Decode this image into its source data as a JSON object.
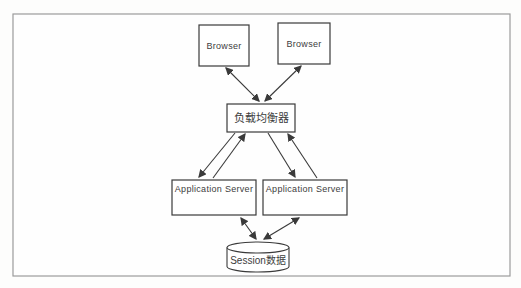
{
  "diagram": {
    "type": "architecture-diagram",
    "nodes": {
      "browser_left": {
        "label": "Browser",
        "shape": "rect"
      },
      "browser_right": {
        "label": "Browser",
        "shape": "rect"
      },
      "load_balancer": {
        "label": "负载均衡器",
        "shape": "rect"
      },
      "app_server_left": {
        "label": "Application Server",
        "shape": "rect"
      },
      "app_server_right": {
        "label": "Application Server",
        "shape": "rect"
      },
      "session_store": {
        "label": "Session数据",
        "shape": "cylinder"
      }
    },
    "edges": [
      {
        "from": "browser_left",
        "to": "load_balancer",
        "direction": "bidirectional"
      },
      {
        "from": "browser_right",
        "to": "load_balancer",
        "direction": "bidirectional"
      },
      {
        "from": "load_balancer",
        "to": "app_server_left",
        "direction": "one-way"
      },
      {
        "from": "app_server_left",
        "to": "load_balancer",
        "direction": "one-way"
      },
      {
        "from": "load_balancer",
        "to": "app_server_right",
        "direction": "one-way"
      },
      {
        "from": "app_server_right",
        "to": "load_balancer",
        "direction": "one-way"
      },
      {
        "from": "app_server_left",
        "to": "session_store",
        "direction": "bidirectional"
      },
      {
        "from": "app_server_right",
        "to": "session_store",
        "direction": "bidirectional"
      }
    ],
    "colors": {
      "line": "#3a3a3a",
      "box_border": "#3a3a3a",
      "box_fill": "#ffffff",
      "text": "#3d3d3d",
      "frame_border": "#9b9b9b",
      "background": "#fdfdfc"
    }
  }
}
